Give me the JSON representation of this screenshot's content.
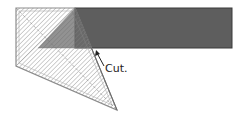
{
  "diagram": {
    "label": "Cut.",
    "colors": {
      "strip": "#5a5a5a",
      "strip_edge": "#3a3a3a",
      "hatch": "#9a9a9a",
      "ruler_outline": "#8a8a8a",
      "overlap": "#7a7a7a",
      "text": "#222222"
    }
  }
}
